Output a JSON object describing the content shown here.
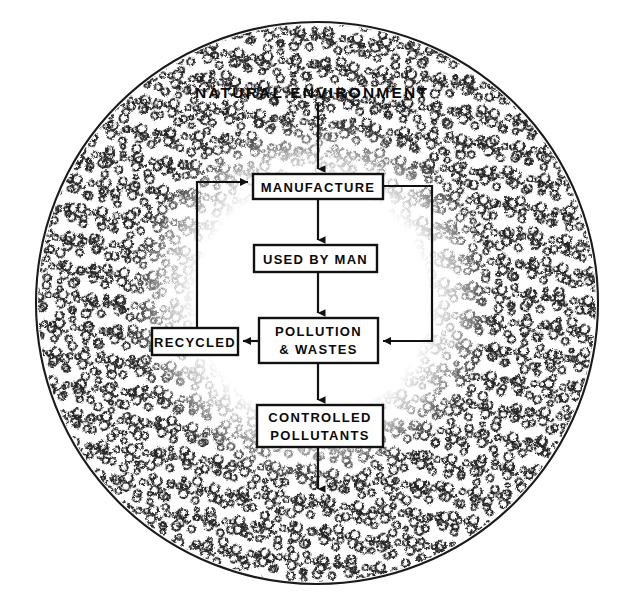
{
  "figure": {
    "type": "flow-diagram",
    "title": "NATURAL ENVIRONMENT"
  },
  "colors": {
    "ink": "#111111",
    "paper": "#ffffff",
    "stipple": "#2b2b2b"
  },
  "environment": {
    "label": "NATURAL ENVIRONMENT",
    "outer_circle": {
      "cx": 317,
      "cy": 303,
      "r": 281
    },
    "inner_clear_area": {
      "cx": 312,
      "cy": 300,
      "r": 170
    }
  },
  "nodes": [
    {
      "id": "manufacture",
      "lines": [
        "MANUFACTURE"
      ],
      "x": 253,
      "y": 174,
      "w": 130,
      "h": 25
    },
    {
      "id": "used-by-man",
      "lines": [
        "USED BY MAN"
      ],
      "x": 254,
      "y": 245,
      "w": 123,
      "h": 27
    },
    {
      "id": "pollution-and-wastes",
      "lines": [
        "POLLUTION",
        "& WASTES"
      ],
      "x": 259,
      "y": 318,
      "w": 119,
      "h": 45
    },
    {
      "id": "recycled",
      "lines": [
        "RECYCLED"
      ],
      "x": 152,
      "y": 328,
      "w": 86,
      "h": 27
    },
    {
      "id": "controlled-pollutants",
      "lines": [
        "CONTROLLED",
        "POLLUTANTS"
      ],
      "x": 257,
      "y": 405,
      "w": 126,
      "h": 42
    }
  ],
  "edges": [
    {
      "id": "environment-to-manufacture",
      "from": "natural-environment",
      "to": "manufacture",
      "path": "M 318 104 L 318 172",
      "arrow": "down"
    },
    {
      "id": "manufacture-to-used-by-man",
      "from": "manufacture",
      "to": "used-by-man",
      "path": "M 318 199 L 318 243",
      "arrow": "down"
    },
    {
      "id": "used-by-man-to-pollution",
      "from": "used-by-man",
      "to": "pollution-and-wastes",
      "path": "M 318 272 L 318 316",
      "arrow": "down"
    },
    {
      "id": "pollution-to-recycled",
      "from": "pollution-and-wastes",
      "to": "recycled",
      "path": "M 259 341 L 240 341",
      "arrow": "left"
    },
    {
      "id": "recycled-to-manufacture",
      "from": "recycled",
      "to": "manufacture",
      "path": "M 197 328 L 197 182 L 251 182",
      "arrow": "right"
    },
    {
      "id": "manufacture-to-pollution",
      "from": "manufacture",
      "to": "pollution-and-wastes",
      "path": "M 383 186 L 432 186 L 432 341 L 380 341",
      "arrow": "left"
    },
    {
      "id": "pollution-to-controlled",
      "from": "pollution-and-wastes",
      "to": "controlled-pollutants",
      "path": "M 318 363 L 318 403",
      "arrow": "down"
    },
    {
      "id": "controlled-to-environment",
      "from": "controlled-pollutants",
      "to": "natural-environment",
      "path": "M 318 447 L 318 492",
      "arrow": "down"
    }
  ]
}
